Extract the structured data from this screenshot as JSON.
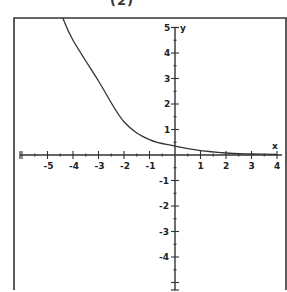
{
  "header": {
    "title_fragment": "(2)"
  },
  "chart_data": {
    "type": "line",
    "title": "(2)",
    "xlabel": "x",
    "ylabel": "y",
    "xlim": [
      -6.3,
      4.3
    ],
    "ylim": [
      -5.3,
      5.4
    ],
    "grid": false,
    "legend": null,
    "x_ticks": [
      -5,
      -4,
      -3,
      -2,
      -1,
      1,
      2,
      3,
      4
    ],
    "y_ticks": [
      5,
      4,
      3,
      2,
      1,
      -1,
      -2,
      -3,
      -4
    ],
    "series": [
      {
        "name": "curve",
        "x": [
          -4.4,
          -4,
          -3,
          -2,
          -1,
          0,
          1,
          2,
          3,
          4
        ],
        "y": [
          5.37,
          4.5,
          2.9,
          1.3,
          0.6,
          0.35,
          0.17,
          0.08,
          0.04,
          0.02
        ]
      }
    ]
  },
  "layout": {
    "frame": {
      "x": 14,
      "y": 18,
      "w": 272,
      "h": 272
    },
    "origin": {
      "px": 175,
      "py": 155
    },
    "unit_px": 25.5,
    "line_color": "#333333"
  }
}
